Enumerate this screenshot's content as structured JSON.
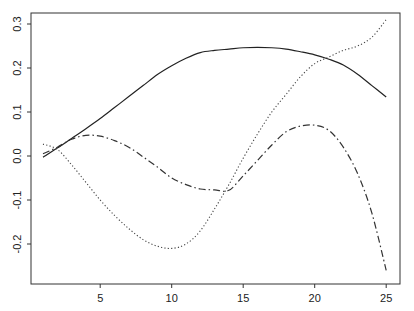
{
  "chart_data": {
    "type": "line",
    "title": "",
    "xlabel": "",
    "ylabel": "",
    "xlim": [
      0.2,
      26
    ],
    "ylim": [
      -0.29,
      0.33
    ],
    "grid": false,
    "legend": null,
    "x_ticks": [
      5,
      10,
      15,
      20,
      25
    ],
    "y_ticks": [
      -0.2,
      -0.1,
      0.0,
      0.1,
      0.2,
      0.3
    ],
    "x_tick_labels": [
      "5",
      "10",
      "15",
      "20",
      "25"
    ],
    "y_tick_labels": [
      "-0.2",
      "-0.1",
      "0.0",
      "0.1",
      "0.2",
      "0.3"
    ],
    "x": [
      1,
      2,
      3,
      4,
      5,
      6,
      7,
      8,
      9,
      10,
      11,
      12,
      13,
      14,
      15,
      16,
      17,
      18,
      19,
      20,
      21,
      22,
      23,
      24,
      25
    ],
    "series": [
      {
        "name": "solid",
        "style": "solid",
        "color": "#222222",
        "values": [
          -0.003,
          0.018,
          0.04,
          0.062,
          0.085,
          0.11,
          0.135,
          0.16,
          0.185,
          0.205,
          0.222,
          0.235,
          0.24,
          0.243,
          0.246,
          0.247,
          0.246,
          0.243,
          0.237,
          0.23,
          0.22,
          0.207,
          0.186,
          0.16,
          0.134
        ]
      },
      {
        "name": "dotted",
        "style": "dotted",
        "color": "#444444",
        "values": [
          0.027,
          0.015,
          -0.02,
          -0.06,
          -0.1,
          -0.135,
          -0.165,
          -0.19,
          -0.205,
          -0.21,
          -0.2,
          -0.17,
          -0.12,
          -0.065,
          -0.005,
          0.05,
          0.1,
          0.14,
          0.18,
          0.21,
          0.225,
          0.24,
          0.25,
          0.27,
          0.31
        ]
      },
      {
        "name": "dash-dot",
        "style": "dashdot",
        "color": "#333333",
        "values": [
          0.005,
          0.02,
          0.038,
          0.047,
          0.045,
          0.035,
          0.02,
          -0.002,
          -0.025,
          -0.05,
          -0.065,
          -0.075,
          -0.077,
          -0.078,
          -0.045,
          -0.01,
          0.025,
          0.055,
          0.068,
          0.07,
          0.058,
          0.02,
          -0.04,
          -0.13,
          -0.26
        ]
      }
    ]
  }
}
